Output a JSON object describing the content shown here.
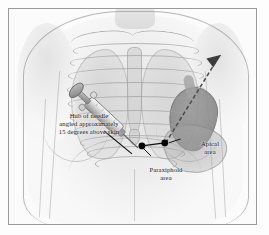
{
  "figure": {
    "frame_color": "#9a9a9a",
    "background": "#fbfbfb",
    "marker_color": "#000000",
    "text_color": "#141414"
  },
  "annotations": {
    "needle_note": "Hub of needle\nangled approximately\n15 degrees above skin",
    "apical": "Apical\narea",
    "paraxiphoid": "Paraxiphoid\narea"
  },
  "markers": [
    {
      "name": "paraxiphoid-site",
      "x": 142,
      "y": 146
    },
    {
      "name": "apical-site",
      "x": 165,
      "y": 143
    }
  ],
  "arrow": {
    "name": "needle-trajectory-arrow",
    "style": "dashed",
    "from_x": 166,
    "from_y": 142,
    "to_x": 222,
    "to_y": 58
  },
  "syringe": {
    "name": "syringe",
    "angle_degrees": 15,
    "hub_x": 138,
    "hub_y": 148,
    "plunger_x": 88,
    "plunger_y": 198
  },
  "leaders": [
    {
      "name": "needle-note-leader",
      "from_x": 104,
      "from_y": 131,
      "to_x": 130,
      "to_y": 152
    },
    {
      "name": "apical-leader",
      "from_x": 180,
      "from_y": 138,
      "to_x": 168,
      "to_y": 143
    },
    {
      "name": "paraxiphoid-leader",
      "from_x": 150,
      "from_y": 155,
      "to_x": 143,
      "to_y": 148
    },
    {
      "name": "marker-connector",
      "from_x": 142,
      "from_y": 146,
      "to_x": 165,
      "to_y": 143
    }
  ]
}
